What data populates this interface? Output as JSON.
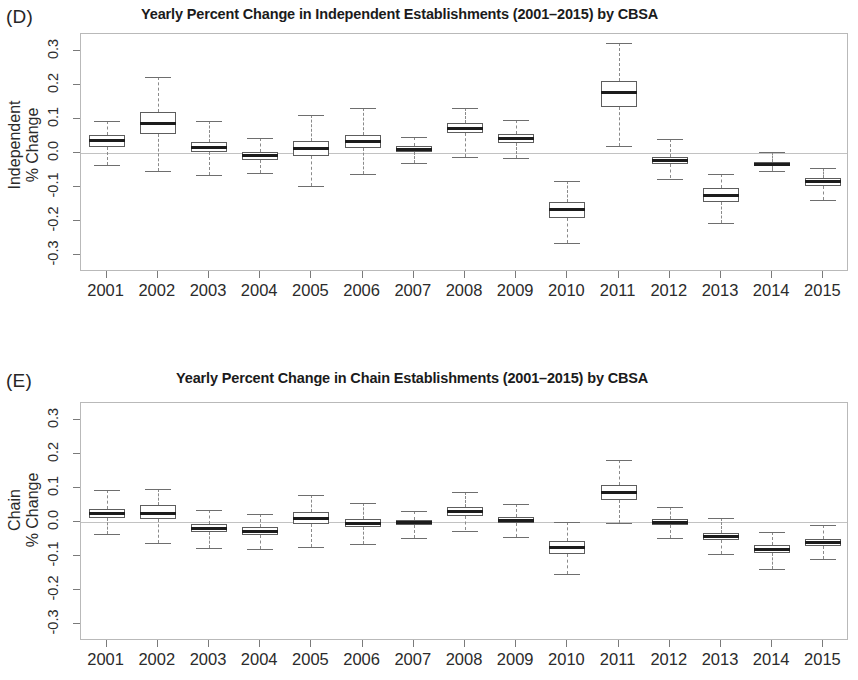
{
  "figure": {
    "panels": [
      {
        "letter": "(D)",
        "title": "Yearly Percent Change in Independent Establishments (2001–2015) by CBSA",
        "ylabel_line1": "Independent",
        "ylabel_line2": "% Change"
      },
      {
        "letter": "(E)",
        "title": "Yearly Percent Change in Chain Establishments (2001–2015) by CBSA",
        "ylabel_line1": "Chain",
        "ylabel_line2": "% Change"
      }
    ]
  },
  "chart_data": [
    {
      "type": "box",
      "panel": "D",
      "title": "Yearly Percent Change in Independent Establishments (2001–2015) by CBSA",
      "xlabel": "",
      "ylabel": "Independent % Change",
      "ylim": [
        -0.35,
        0.35
      ],
      "yticks": [
        0.3,
        0.2,
        0.1,
        0.0,
        -0.1,
        -0.2,
        -0.3
      ],
      "ytick_labels": [
        "0.3",
        "0.2",
        "0.1",
        "0.0",
        "-0.1",
        "-0.2",
        "-0.3"
      ],
      "grid": false,
      "legend": "none",
      "reference_line": 0.0,
      "categories": [
        "2001",
        "2002",
        "2003",
        "2004",
        "2005",
        "2006",
        "2007",
        "2008",
        "2009",
        "2010",
        "2011",
        "2012",
        "2013",
        "2014",
        "2015"
      ],
      "boxes": [
        {
          "x": "2001",
          "whisker_low": -0.035,
          "q1": 0.018,
          "median": 0.037,
          "q3": 0.052,
          "whisker_high": 0.095
        },
        {
          "x": "2002",
          "whisker_low": -0.053,
          "q1": 0.055,
          "median": 0.087,
          "q3": 0.122,
          "whisker_high": 0.223
        },
        {
          "x": "2003",
          "whisker_low": -0.065,
          "q1": 0.002,
          "median": 0.015,
          "q3": 0.032,
          "whisker_high": 0.093
        },
        {
          "x": "2004",
          "whisker_low": -0.058,
          "q1": -0.02,
          "median": -0.008,
          "q3": 0.003,
          "whisker_high": 0.043
        },
        {
          "x": "2005",
          "whisker_low": -0.098,
          "q1": -0.01,
          "median": 0.013,
          "q3": 0.035,
          "whisker_high": 0.112
        },
        {
          "x": "2006",
          "whisker_low": -0.063,
          "q1": 0.014,
          "median": 0.033,
          "q3": 0.053,
          "whisker_high": 0.133
        },
        {
          "x": "2007",
          "whisker_low": -0.03,
          "q1": 0.002,
          "median": 0.011,
          "q3": 0.02,
          "whisker_high": 0.046
        },
        {
          "x": "2008",
          "whisker_low": -0.012,
          "q1": 0.06,
          "median": 0.072,
          "q3": 0.088,
          "whisker_high": 0.133
        },
        {
          "x": "2009",
          "whisker_low": -0.015,
          "q1": 0.03,
          "median": 0.043,
          "q3": 0.057,
          "whisker_high": 0.098
        },
        {
          "x": "2010",
          "whisker_low": -0.264,
          "q1": -0.192,
          "median": -0.166,
          "q3": -0.143,
          "whisker_high": -0.081
        },
        {
          "x": "2011",
          "whisker_low": 0.022,
          "q1": 0.135,
          "median": 0.178,
          "q3": 0.213,
          "whisker_high": 0.325
        },
        {
          "x": "2012",
          "whisker_low": -0.075,
          "q1": -0.031,
          "median": -0.021,
          "q3": -0.012,
          "whisker_high": 0.04
        },
        {
          "x": "2013",
          "whisker_low": -0.207,
          "q1": -0.143,
          "median": -0.124,
          "q3": -0.104,
          "whisker_high": -0.063
        },
        {
          "x": "2014",
          "whisker_low": -0.052,
          "q1": -0.039,
          "median": -0.033,
          "q3": -0.027,
          "whisker_high": 0.003
        },
        {
          "x": "2015",
          "whisker_low": -0.137,
          "q1": -0.098,
          "median": -0.085,
          "q3": -0.073,
          "whisker_high": -0.043
        }
      ]
    },
    {
      "type": "box",
      "panel": "E",
      "title": "Yearly Percent Change in Chain Establishments (2001–2015) by CBSA",
      "xlabel": "",
      "ylabel": "Chain % Change",
      "ylim": [
        -0.35,
        0.35
      ],
      "yticks": [
        0.3,
        0.2,
        0.1,
        0.0,
        -0.1,
        -0.2,
        -0.3
      ],
      "ytick_labels": [
        "0.3",
        "0.2",
        "0.1",
        "0.0",
        "-0.1",
        "-0.2",
        "-0.3"
      ],
      "grid": false,
      "legend": "none",
      "reference_line": 0.0,
      "categories": [
        "2001",
        "2002",
        "2003",
        "2004",
        "2005",
        "2006",
        "2007",
        "2008",
        "2009",
        "2010",
        "2011",
        "2012",
        "2013",
        "2014",
        "2015"
      ],
      "boxes": [
        {
          "x": "2001",
          "whisker_low": -0.036,
          "q1": 0.012,
          "median": 0.024,
          "q3": 0.038,
          "whisker_high": 0.093
        },
        {
          "x": "2002",
          "whisker_low": -0.063,
          "q1": 0.009,
          "median": 0.026,
          "q3": 0.049,
          "whisker_high": 0.098
        },
        {
          "x": "2003",
          "whisker_low": -0.077,
          "q1": -0.03,
          "median": -0.018,
          "q3": -0.006,
          "whisker_high": 0.036
        },
        {
          "x": "2004",
          "whisker_low": -0.078,
          "q1": -0.038,
          "median": -0.027,
          "q3": -0.015,
          "whisker_high": 0.023
        },
        {
          "x": "2005",
          "whisker_low": -0.073,
          "q1": -0.005,
          "median": 0.011,
          "q3": 0.03,
          "whisker_high": 0.078
        },
        {
          "x": "2006",
          "whisker_low": -0.065,
          "q1": -0.015,
          "median": -0.004,
          "q3": 0.008,
          "whisker_high": 0.056
        },
        {
          "x": "2007",
          "whisker_low": -0.047,
          "q1": -0.008,
          "median": -0.002,
          "q3": 0.006,
          "whisker_high": 0.031
        },
        {
          "x": "2008",
          "whisker_low": -0.025,
          "q1": 0.018,
          "median": 0.031,
          "q3": 0.043,
          "whisker_high": 0.088
        },
        {
          "x": "2009",
          "whisker_low": -0.043,
          "q1": -0.004,
          "median": 0.005,
          "q3": 0.015,
          "whisker_high": 0.053
        },
        {
          "x": "2010",
          "whisker_low": -0.152,
          "q1": -0.094,
          "median": -0.074,
          "q3": -0.057,
          "whisker_high": -0.001
        },
        {
          "x": "2011",
          "whisker_low": -0.004,
          "q1": 0.065,
          "median": 0.087,
          "q3": 0.108,
          "whisker_high": 0.181
        },
        {
          "x": "2012",
          "whisker_low": -0.048,
          "q1": -0.01,
          "median": -0.001,
          "q3": 0.01,
          "whisker_high": 0.045
        },
        {
          "x": "2013",
          "whisker_low": -0.093,
          "q1": -0.052,
          "median": -0.042,
          "q3": -0.032,
          "whisker_high": 0.013
        },
        {
          "x": "2014",
          "whisker_low": -0.139,
          "q1": -0.092,
          "median": -0.08,
          "q3": -0.068,
          "whisker_high": -0.028
        },
        {
          "x": "2015",
          "whisker_low": -0.11,
          "q1": -0.07,
          "median": -0.06,
          "q3": -0.05,
          "whisker_high": -0.008
        }
      ]
    }
  ]
}
